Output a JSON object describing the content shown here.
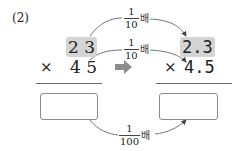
{
  "problem": {
    "label": "(2)"
  },
  "left": {
    "multiplicand": "2 3",
    "operator": "×",
    "multiplier": "4 5",
    "answer_box": ""
  },
  "right": {
    "multiplicand": "2.3",
    "operator": "×",
    "multiplier": "4.5",
    "answer_box": ""
  },
  "relations": {
    "top": {
      "numerator": "1",
      "denominator": "10",
      "suffix": "배"
    },
    "middle": {
      "numerator": "1",
      "denominator": "10",
      "suffix": "배"
    },
    "bottom": {
      "numerator": "1",
      "denominator": "100",
      "suffix": "배"
    }
  },
  "colors": {
    "highlight": "#d4d4d4",
    "arrow": "#8c8c8c",
    "curve": "#555555"
  }
}
